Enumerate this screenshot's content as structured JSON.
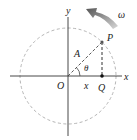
{
  "diagram": {
    "type": "reference-circle",
    "labels": {
      "y_axis": "y",
      "x_axis": "x",
      "origin": "O",
      "point_p": "P",
      "point_q": "Q",
      "amplitude": "A",
      "angle": "θ",
      "x_displacement": "x",
      "angular_velocity": "ω"
    },
    "colors": {
      "axes": "#333333",
      "circle": "#b0b0b0",
      "arrow": "#707070",
      "text": "#222222"
    }
  }
}
